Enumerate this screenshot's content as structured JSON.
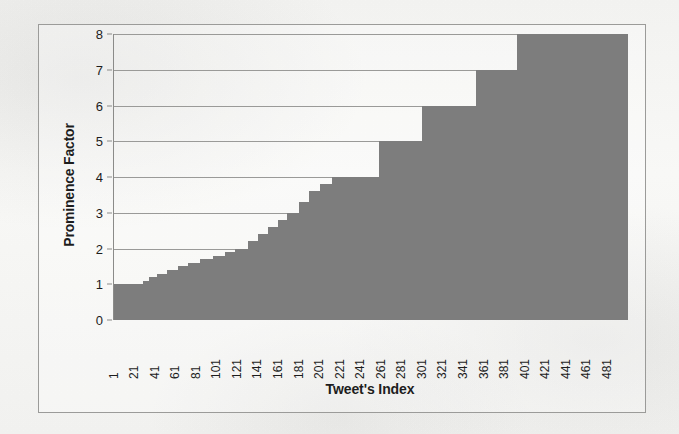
{
  "figure": {
    "frame_border_color": "#9b9b99",
    "background_color": "#f7f7f5"
  },
  "chart_data": {
    "type": "bar",
    "title": "",
    "xlabel": "Tweet's Index",
    "ylabel": "Prominence Factor",
    "xlim": [
      1,
      500
    ],
    "ylim": [
      0,
      8
    ],
    "yticks": [
      0,
      1,
      2,
      3,
      4,
      5,
      6,
      7,
      8
    ],
    "xticks": [
      1,
      21,
      41,
      61,
      81,
      101,
      121,
      141,
      161,
      181,
      201,
      221,
      241,
      261,
      281,
      301,
      321,
      341,
      361,
      381,
      401,
      421,
      441,
      461,
      481
    ],
    "grid": "horizontal",
    "legend": "none",
    "bar_color": "#7d7d7d",
    "steps": [
      {
        "start_index": 1,
        "end_index": 28,
        "value": 1
      },
      {
        "start_index": 29,
        "end_index": 34,
        "value": 1.1
      },
      {
        "start_index": 35,
        "end_index": 42,
        "value": 1.2
      },
      {
        "start_index": 43,
        "end_index": 52,
        "value": 1.3
      },
      {
        "start_index": 53,
        "end_index": 62,
        "value": 1.4
      },
      {
        "start_index": 63,
        "end_index": 72,
        "value": 1.5
      },
      {
        "start_index": 73,
        "end_index": 84,
        "value": 1.6
      },
      {
        "start_index": 85,
        "end_index": 96,
        "value": 1.7
      },
      {
        "start_index": 97,
        "end_index": 108,
        "value": 1.8
      },
      {
        "start_index": 109,
        "end_index": 118,
        "value": 1.9
      },
      {
        "start_index": 119,
        "end_index": 130,
        "value": 2
      },
      {
        "start_index": 131,
        "end_index": 140,
        "value": 2.2
      },
      {
        "start_index": 141,
        "end_index": 150,
        "value": 2.4
      },
      {
        "start_index": 151,
        "end_index": 160,
        "value": 2.6
      },
      {
        "start_index": 161,
        "end_index": 168,
        "value": 2.8
      },
      {
        "start_index": 169,
        "end_index": 180,
        "value": 3
      },
      {
        "start_index": 181,
        "end_index": 190,
        "value": 3.3
      },
      {
        "start_index": 191,
        "end_index": 200,
        "value": 3.6
      },
      {
        "start_index": 201,
        "end_index": 212,
        "value": 3.8
      },
      {
        "start_index": 213,
        "end_index": 258,
        "value": 4
      },
      {
        "start_index": 259,
        "end_index": 300,
        "value": 5
      },
      {
        "start_index": 301,
        "end_index": 352,
        "value": 6
      },
      {
        "start_index": 353,
        "end_index": 392,
        "value": 7
      },
      {
        "start_index": 393,
        "end_index": 500,
        "value": 8
      }
    ],
    "values_by_tick": [
      {
        "x": 1,
        "y": 1
      },
      {
        "x": 21,
        "y": 1
      },
      {
        "x": 41,
        "y": 1.2
      },
      {
        "x": 61,
        "y": 1.4
      },
      {
        "x": 81,
        "y": 1.6
      },
      {
        "x": 101,
        "y": 1.8
      },
      {
        "x": 121,
        "y": 2
      },
      {
        "x": 141,
        "y": 2.4
      },
      {
        "x": 161,
        "y": 2.6
      },
      {
        "x": 181,
        "y": 3.3
      },
      {
        "x": 201,
        "y": 3.8
      },
      {
        "x": 221,
        "y": 4
      },
      {
        "x": 241,
        "y": 4
      },
      {
        "x": 261,
        "y": 5
      },
      {
        "x": 281,
        "y": 5
      },
      {
        "x": 301,
        "y": 6
      },
      {
        "x": 321,
        "y": 6
      },
      {
        "x": 341,
        "y": 6
      },
      {
        "x": 361,
        "y": 7
      },
      {
        "x": 381,
        "y": 7
      },
      {
        "x": 401,
        "y": 8
      },
      {
        "x": 421,
        "y": 8
      },
      {
        "x": 441,
        "y": 8
      },
      {
        "x": 461,
        "y": 8
      },
      {
        "x": 481,
        "y": 8
      }
    ]
  }
}
